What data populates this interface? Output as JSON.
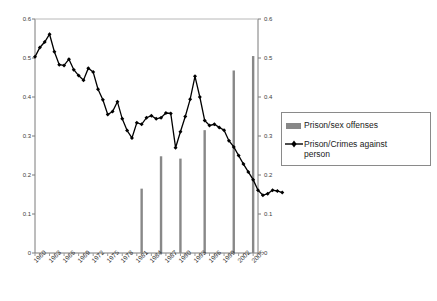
{
  "chart_data": {
    "type": "line",
    "title": "",
    "xlabel": "",
    "ylabel": "",
    "ylim": [
      0,
      0.6
    ],
    "xlim": [
      1960,
      2006
    ],
    "ytick_labels": [
      "0.6",
      "0.5",
      "0.4",
      "0.3",
      "0.2",
      "0.1",
      "0"
    ],
    "ytick_values": [
      0.6,
      0.5,
      0.4,
      0.3,
      0.2,
      0.1,
      0
    ],
    "right_axis_tick_labels": [
      "0.6",
      "0.5",
      "0.4",
      "0.3",
      "0.2",
      "0.1",
      "0"
    ],
    "xtick_labels": [
      "1960",
      "1963",
      "1966",
      "1969",
      "1972",
      "1975",
      "1978",
      "1981",
      "1984",
      "1987",
      "1990",
      "1993",
      "1996",
      "1999",
      "2002",
      "2005"
    ],
    "xtick_values": [
      1960,
      1963,
      1966,
      1969,
      1972,
      1975,
      1978,
      1981,
      1984,
      1987,
      1990,
      1993,
      1996,
      1999,
      2002,
      2005
    ],
    "grid": false,
    "legend_position": "right",
    "series": [
      {
        "name": "Prison/sex offenses",
        "type": "bar",
        "color": "#888888",
        "x": [
          1982,
          1986,
          1990,
          1995,
          2001,
          2005
        ],
        "values": [
          0.165,
          0.248,
          0.242,
          0.315,
          0.468,
          0.505
        ]
      },
      {
        "name": "Prison/Crimes against person",
        "type": "line",
        "color": "#000000",
        "marker": "diamond",
        "x": [
          1960,
          1961,
          1962,
          1963,
          1964,
          1965,
          1966,
          1967,
          1968,
          1969,
          1970,
          1971,
          1972,
          1973,
          1974,
          1975,
          1976,
          1977,
          1978,
          1979,
          1980,
          1981,
          1982,
          1983,
          1984,
          1985,
          1986,
          1987,
          1988,
          1989,
          1990,
          1991,
          1992,
          1993,
          1994,
          1995,
          1996,
          1997,
          1998,
          1999,
          2000,
          2001,
          2002,
          2003,
          2004,
          2005,
          2006
        ],
        "values": [
          0.503,
          0.527,
          0.541,
          0.561,
          0.516,
          0.483,
          0.481,
          0.497,
          0.47,
          0.455,
          0.443,
          0.474,
          0.464,
          0.42,
          0.393,
          0.355,
          0.363,
          0.388,
          0.344,
          0.314,
          0.295,
          0.334,
          0.33,
          0.347,
          0.352,
          0.344,
          0.347,
          0.359,
          0.358,
          0.27,
          0.311,
          0.35,
          0.394,
          0.453,
          0.4,
          0.34,
          0.327,
          0.33,
          0.322,
          0.315,
          0.288,
          0.272,
          0.25,
          0.228,
          0.208,
          0.188,
          0.161
        ],
        "values_tail": [
          0.148,
          0.152,
          0.161,
          0.159,
          0.155
        ]
      }
    ],
    "legend": [
      {
        "label": "Prison/sex offenses",
        "swatch": "bar",
        "color": "#888888"
      },
      {
        "label": "Prison/Crimes against\nperson",
        "swatch": "line-marker",
        "color": "#000000"
      }
    ]
  },
  "plot": {
    "left": 35,
    "right": 258,
    "top": 19,
    "bottom": 253
  }
}
